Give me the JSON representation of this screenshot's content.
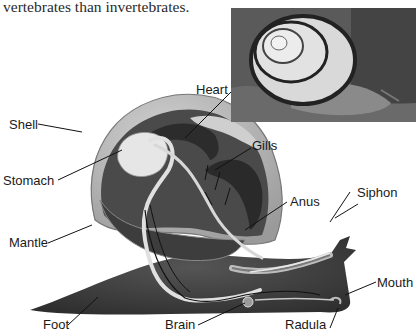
{
  "caption": "vertebrates than invertebrates.",
  "photo": {
    "subject": "garden snail photograph",
    "icon": "snail-photo"
  },
  "diagram": {
    "labels": {
      "shell": "Shell",
      "heart": "Heart",
      "gills": "Gills",
      "stomach": "Stomach",
      "anus": "Anus",
      "siphon": "Siphon",
      "mantle": "Mantle",
      "mouth": "Mouth",
      "foot": "Foot",
      "brain": "Brain",
      "radula": "Radula"
    }
  },
  "colors": {
    "body_dark": "#3c3c3c",
    "shell_light": "#bdbdbd",
    "organ_light": "#e6e6e6",
    "text": "#1a1a1a"
  }
}
